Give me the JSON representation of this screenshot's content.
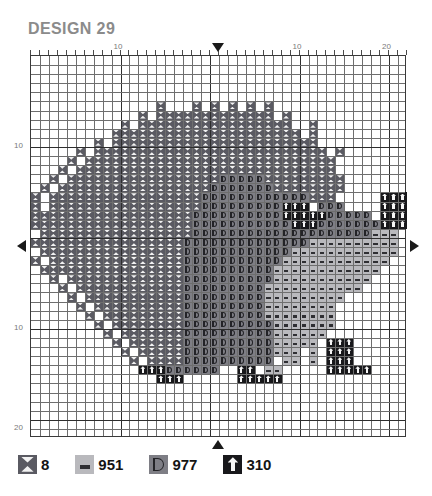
{
  "title": "DESIGN 29",
  "colors": {
    "sym_8": "#5a5a62",
    "sym_951": "#b9b9bd",
    "sym_977": "#7e7e85",
    "sym_310": "#18181b",
    "grid_line": "#6e6e6e",
    "grid_major": "#2e2e2e",
    "title_color": "#8b8b8b",
    "marker": "#1a1a1a"
  },
  "rulers": {
    "top": [
      {
        "label": "10",
        "col": 10
      },
      {
        "label": "10",
        "col": 30
      },
      {
        "label": "20",
        "col": 40
      }
    ],
    "left": [
      {
        "label": "10",
        "row": 10
      },
      {
        "label": "10",
        "row": 30
      },
      {
        "label": "20",
        "row": 41
      }
    ],
    "center_markers": [
      "top",
      "left",
      "right",
      "bottom"
    ]
  },
  "grid": {
    "cols": 42,
    "rows": 42,
    "major_every": 10,
    "cell_px": 8.95
  },
  "legend": {
    "items": [
      {
        "icon": "hourglass-icon",
        "symbol": "8",
        "code": "8",
        "swatch": "#5a5a62"
      },
      {
        "icon": "bar-icon",
        "symbol": "951",
        "code": "951",
        "swatch": "#b9b9bd"
      },
      {
        "icon": "d-shape-icon",
        "symbol": "977",
        "code": "977",
        "swatch": "#7e7e85"
      },
      {
        "icon": "up-arrow-icon",
        "symbol": "310",
        "code": "310",
        "swatch": "#18181b"
      }
    ]
  },
  "chart_data": {
    "type": "heatmap",
    "title": "DESIGN 29",
    "xlabel": "",
    "ylabel": "",
    "legend_position": "bottom",
    "grid": true,
    "symbol_key": {
      ".": "empty",
      "A": "8",
      "B": "951",
      "C": "977",
      "D": "310"
    },
    "pattern": [
      "..........................................",
      "..........................................",
      "..........................................",
      "..........................................",
      "..........................................",
      "..............A...A.A.A.A.A...............",
      "............A.AAAAAAAAAAAAA.A.............",
      "..........A.AAAAAAAAAAAAAAAAA..A..........",
      ".........AAAAAAAAAAAAAAAAAAAAA.A..........",
      ".......A.AAAAAAAAAAAAAAAAAAAAAAA..........",
      ".....A.AAAAAAAAAAAAAAAAAAAAAAAAAA.A.......",
      "....A.AAAAAAAAAAAAAAAAAAAAAAAAAAAA........",
      "...A.AAAAAAAAAAAAAAAAAAAAAAAAAAAAA........",
      "..A.AAAAAAAAAAAAAAAAACCCCCAAAAAAAAA.......",
      ".A.AAAAAAAAAAAAAAAAACCCCCCCAAAAAAAA.......",
      "A.AAAAAAAAAAAAAAAAACCCCCCCCCCCCAAA.....DDD",
      "A.AAAAAAAAAAAAAAAAACCCCCCCCCDDD.CCC....DDD",
      "AAAAAAAAAAAAAAAAAACCCCCCCCCCDDDDDCCCCC.DDD",
      "AAAAAAAAAAAAAAAAAACCCCCCCCCCCDDDCCCCCCCDDD",
      ".AAAAAAAAAAAAAAAAACCCCCCCCCCCCCCCCCCCCBBB.",
      "AAAAAAAAAAAAAAAAACCCCCCCCCCCCCCBBBBBBBBBB.",
      ".AAAAAAAAAAAAAAAACCCCCCCCCCCCBBBBBBBBBBBB.",
      "A.AAAAAAAAAAAAAAACCCCCCCCCCCBBBBBBBBBBBB..",
      ".AAAAAAAAAAAAAAAACCCCCCCCCCBBBBBBBBBBBB...",
      "..A.AAAAAAAAAAAAACCCCCCCCCCBBBBBBBBBBB....",
      "...A.AAAAAAAAAAAACCCCCCCCCBBBBBBBBBBB.....",
      "....A.AAAAAAAAAAACCCCCCCCCBBBBBBBBB.......",
      ".....A.AAAAAAAAAACCCCCCCCCBBBBBBBB........",
      "......A.AAAAAAAAACCCCCCCCCBBBBBBBB........",
      ".......A.AAAAAAAACCCCCCCCCCBBBBBBB........",
      "........A.AAAAAAACCCCCCCCCCBBBBBB.........",
      ".........A.AAAAAACCCCCCCCCCBBBBB.DDD......",
      "..........A.AAAAACCCCCCCCCCBBB.B.DDD......",
      "...........A.AAAACCCCCCCCCC.BB.B.DDD......",
      "............DDDCCCCCC..DD.BB.....DDDDD....",
      "..............DDD......DDDDD..............",
      "..........................................",
      "..........................................",
      "..........................................",
      "..........................................",
      "..........................................",
      ".........................................."
    ]
  }
}
